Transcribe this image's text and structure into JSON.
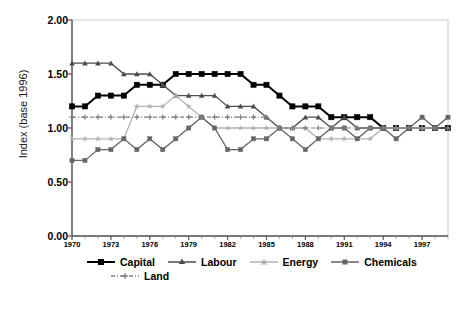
{
  "chart_data": {
    "type": "line",
    "title": "",
    "xlabel": "",
    "ylabel": "Index (base 1996)",
    "ylim": [
      0.0,
      2.0
    ],
    "yticks": [
      "0.00",
      "0.50",
      "1.00",
      "1.50",
      "2.00"
    ],
    "ytick_values": [
      0.0,
      0.5,
      1.0,
      1.5,
      2.0
    ],
    "grid": false,
    "legend_position": "bottom",
    "x": [
      1970,
      1971,
      1972,
      1973,
      1974,
      1975,
      1976,
      1977,
      1978,
      1979,
      1980,
      1981,
      1982,
      1983,
      1984,
      1985,
      1986,
      1987,
      1988,
      1989,
      1990,
      1991,
      1992,
      1993,
      1994,
      1995,
      1996,
      1997,
      1998,
      1999
    ],
    "xtick_labels": [
      "1970",
      "1973",
      "1976",
      "1979",
      "1982",
      "1985",
      "1988",
      "1991",
      "1994",
      "1997"
    ],
    "xtick_values": [
      1970,
      1973,
      1976,
      1979,
      1982,
      1985,
      1988,
      1991,
      1994,
      1997
    ],
    "xlim": [
      1970,
      1999
    ],
    "series": [
      {
        "name": "Capital",
        "color": "#000000",
        "marker": "square",
        "dash": "solid",
        "width": 2.0,
        "values": [
          1.2,
          1.2,
          1.3,
          1.3,
          1.3,
          1.4,
          1.4,
          1.4,
          1.5,
          1.5,
          1.5,
          1.5,
          1.5,
          1.5,
          1.4,
          1.4,
          1.3,
          1.2,
          1.2,
          1.2,
          1.1,
          1.1,
          1.1,
          1.1,
          1.0,
          1.0,
          1.0,
          1.0,
          1.0,
          1.0
        ]
      },
      {
        "name": "Labour",
        "color": "#4d4d4d",
        "marker": "triangle",
        "dash": "solid",
        "width": 1.3,
        "values": [
          1.6,
          1.6,
          1.6,
          1.6,
          1.5,
          1.5,
          1.5,
          1.4,
          1.3,
          1.3,
          1.3,
          1.3,
          1.2,
          1.2,
          1.2,
          1.1,
          1.0,
          1.0,
          1.1,
          1.1,
          1.0,
          1.1,
          1.0,
          1.0,
          1.0,
          1.0,
          1.0,
          1.0,
          1.0,
          1.0
        ]
      },
      {
        "name": "Energy",
        "color": "#b3b3b3",
        "marker": "star",
        "dash": "solid",
        "width": 1.3,
        "values": [
          0.9,
          0.9,
          0.9,
          0.9,
          0.9,
          1.2,
          1.2,
          1.2,
          1.3,
          1.2,
          1.1,
          1.0,
          1.0,
          1.0,
          1.0,
          1.0,
          1.0,
          1.0,
          1.0,
          0.9,
          0.9,
          0.9,
          0.9,
          0.9,
          1.0,
          1.0,
          1.0,
          1.0,
          1.0,
          1.1
        ]
      },
      {
        "name": "Chemicals",
        "color": "#666666",
        "marker": "square-small",
        "dash": "solid",
        "width": 1.3,
        "values": [
          0.7,
          0.7,
          0.8,
          0.8,
          0.9,
          0.8,
          0.9,
          0.8,
          0.9,
          1.0,
          1.1,
          1.0,
          0.8,
          0.8,
          0.9,
          0.9,
          1.0,
          0.9,
          0.8,
          0.9,
          1.0,
          1.0,
          0.9,
          1.0,
          1.0,
          0.9,
          1.0,
          1.1,
          1.0,
          1.1
        ]
      },
      {
        "name": "Land",
        "color": "#808080",
        "marker": "plus",
        "dash": "dashdot",
        "width": 1.2,
        "values": [
          1.1,
          1.1,
          1.1,
          1.1,
          1.1,
          1.1,
          1.1,
          1.1,
          1.1,
          1.1,
          1.1,
          1.1,
          1.1,
          1.1,
          1.1,
          1.1,
          1.0,
          1.0,
          1.0,
          1.0,
          1.0,
          1.0,
          1.0,
          1.0,
          1.0,
          1.0,
          1.0,
          1.0,
          1.0,
          1.0
        ]
      }
    ],
    "legend": [
      {
        "label": "Capital",
        "color": "#000000"
      },
      {
        "label": "Labour",
        "color": "#4d4d4d"
      },
      {
        "label": "Energy",
        "color": "#b3b3b3"
      },
      {
        "label": "Chemicals",
        "color": "#666666"
      },
      {
        "label": "Land",
        "color": "#808080"
      }
    ]
  }
}
